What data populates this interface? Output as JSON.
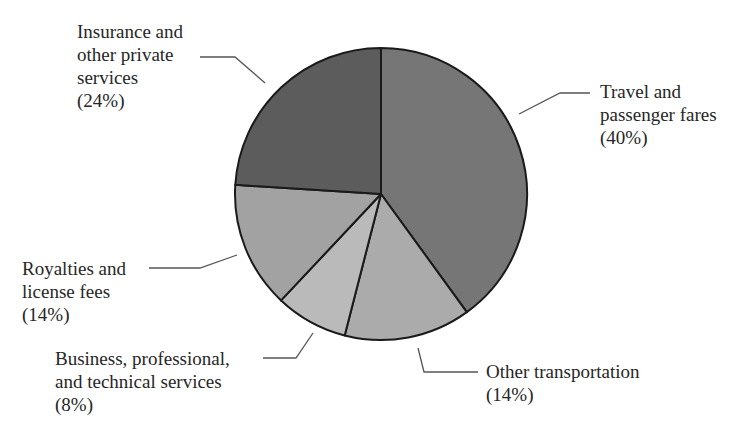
{
  "chart_data": {
    "type": "pie",
    "title": "",
    "start_angle_deg": 0,
    "direction": "clockwise",
    "slices": [
      {
        "label": "Travel and passenger fares",
        "value": 40,
        "color": "#767676"
      },
      {
        "label": "Other transportation",
        "value": 14,
        "color": "#ababab"
      },
      {
        "label": "Business, professional, and technical services",
        "value": 8,
        "color": "#bababa"
      },
      {
        "label": "Royalties and license fees",
        "value": 14,
        "color": "#a2a2a2"
      },
      {
        "label": "Insurance and other private services",
        "value": 24,
        "color": "#5c5c5c"
      }
    ]
  },
  "labels": {
    "insurance": {
      "lines": [
        "Insurance and",
        "other private",
        "services",
        "(24%)"
      ]
    },
    "travel": {
      "lines": [
        "Travel and",
        "passenger fares",
        "(40%)"
      ]
    },
    "royalties": {
      "lines": [
        "Royalties and",
        "license fees",
        "(14%)"
      ]
    },
    "business": {
      "lines": [
        "Business, professional,",
        "and technical services",
        "(8%)"
      ]
    },
    "other_transport": {
      "lines": [
        "Other transportation",
        "(14%)"
      ]
    }
  }
}
